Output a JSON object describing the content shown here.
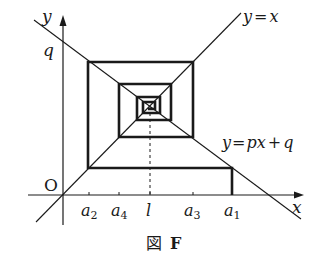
{
  "figure": {
    "caption_prefix": "図",
    "caption_letter": "F",
    "axes": {
      "x_label": "x",
      "y_label": "y",
      "origin_label": "O",
      "y_intercept_label": "q"
    },
    "lines": {
      "identity": {
        "label_lhs": "y",
        "label_eq": "=",
        "label_rhs": "x"
      },
      "affine": {
        "label_lhs": "y",
        "label_eq": "=",
        "label_rhs_a": "px",
        "label_plus": "+",
        "label_rhs_b": "q"
      }
    },
    "x_ticks": [
      {
        "base": "a",
        "sub": "2"
      },
      {
        "base": "a",
        "sub": "4"
      },
      {
        "base": "l",
        "sub": ""
      },
      {
        "base": "a",
        "sub": "3"
      },
      {
        "base": "a",
        "sub": "1"
      }
    ],
    "colors": {
      "ink": "#1a1a1a",
      "background": "#ffffff"
    }
  }
}
